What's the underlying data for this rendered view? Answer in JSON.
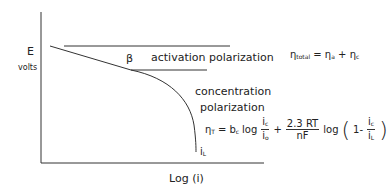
{
  "diagram": {
    "type": "polarization-curve",
    "y_axis": {
      "label": "E",
      "unit": "volts"
    },
    "x_axis": {
      "label": "Log (i)"
    },
    "curve_point_label": "β",
    "limit_label": {
      "base": "i",
      "sub": "L"
    },
    "regions": [
      {
        "label": "activation polarization"
      },
      {
        "label_line1": "concentration",
        "label_line2": "polarization"
      }
    ],
    "equations": {
      "total": {
        "lhs": "η",
        "lhs_sub": "total",
        "eq": "=",
        "a": "η",
        "a_sub": "a",
        "plus": "+",
        "c": "η",
        "c_sub": "c"
      },
      "eta_t": {
        "lhs": "η",
        "lhs_sub": "T",
        "eq": "=",
        "coef": "b",
        "coef_sub": "c",
        "log": "log",
        "frac1_num": "i",
        "frac1_num_sub": "c",
        "frac1_den": "i",
        "frac1_den_sub": "o",
        "plus": "+",
        "frac2_num": "2.3 RT",
        "frac2_den": "nF",
        "log2": "log",
        "open": "(",
        "one_minus": "1-",
        "frac3_num": "i",
        "frac3_num_sub": "c",
        "frac3_den": "i",
        "frac3_den_sub": "L",
        "close": ")"
      }
    },
    "colors": {
      "line": "#333333",
      "text": "#222222",
      "background": "#ffffff"
    }
  }
}
